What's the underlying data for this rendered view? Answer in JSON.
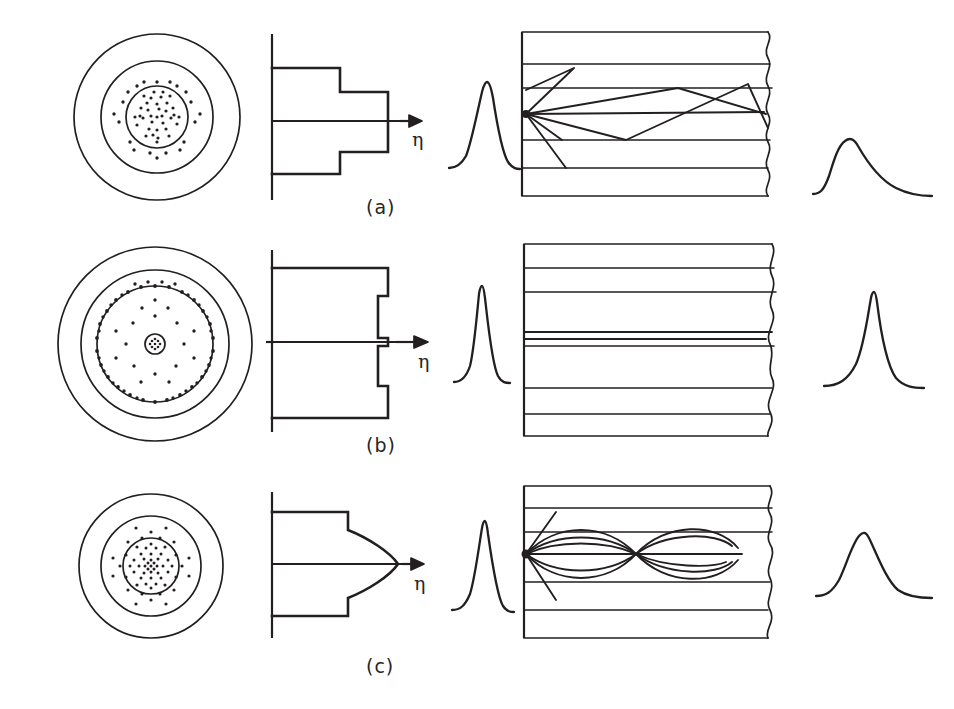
{
  "figure": {
    "kind": "optical-fiber-types-diagram",
    "background": "#ffffff",
    "ink": "#231f20",
    "columns": [
      "fiber-cross-section",
      "refractive-index-profile",
      "input-pulse",
      "ray-propagation",
      "output-pulse"
    ],
    "axis_label": "η",
    "panels": [
      {
        "id": "a",
        "label": "(a)",
        "fiber_type": "multimode step-index",
        "cross_section": {
          "rings": 3,
          "core_dot_density": "dense",
          "dotted_zones": [
            "core",
            "inner-cladding-sparse"
          ]
        },
        "index_profile": {
          "shape": "step",
          "steps": [
            "cladding",
            "core"
          ],
          "axis_label": "η"
        },
        "input_pulse": {
          "shape": "narrow-peak",
          "width": "narrow"
        },
        "propagation": {
          "mode": "multimode",
          "ray_paths": "zigzag-total-internal-reflection",
          "ray_count": 6
        },
        "output_pulse": {
          "shape": "broadened-asymmetric",
          "width": "wide",
          "dispersion": "large"
        }
      },
      {
        "id": "b",
        "label": "(b)",
        "fiber_type": "single-mode step-index",
        "cross_section": {
          "rings": 3,
          "core_dot_density": "tiny-dense-center",
          "dotted_zones": [
            "small-core",
            "annular-dotted-band",
            "sparse-inner"
          ]
        },
        "index_profile": {
          "shape": "narrow-step-with-central-spike",
          "steps": [
            "cladding",
            "narrow-core"
          ],
          "axis_label": "η"
        },
        "input_pulse": {
          "shape": "very-narrow-peak",
          "width": "very-narrow"
        },
        "propagation": {
          "mode": "single-mode",
          "ray_paths": "straight-parallel",
          "ray_count": 2
        },
        "output_pulse": {
          "shape": "narrow-peak",
          "width": "narrow",
          "dispersion": "minimal"
        }
      },
      {
        "id": "c",
        "label": "(c)",
        "fiber_type": "graded-index multimode",
        "cross_section": {
          "rings": 3,
          "core_dot_density": "graded-densest-at-center",
          "dotted_zones": [
            "core-graded"
          ]
        },
        "index_profile": {
          "shape": "parabolic-graded",
          "steps": [
            "cladding",
            "graded-core"
          ],
          "axis_label": "η"
        },
        "input_pulse": {
          "shape": "narrow-peak",
          "width": "narrow"
        },
        "propagation": {
          "mode": "multimode-graded",
          "ray_paths": "sinusoidal-refocusing",
          "periods": 3
        },
        "output_pulse": {
          "shape": "broadened-symmetric",
          "width": "medium",
          "dispersion": "moderate"
        }
      }
    ]
  }
}
